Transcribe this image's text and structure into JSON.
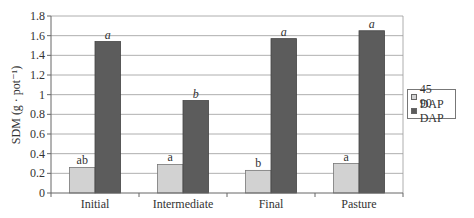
{
  "chart_data": {
    "type": "bar",
    "title": "",
    "xlabel": "",
    "ylabel": "SDM (g · pot⁻¹)",
    "ylim": [
      0,
      1.8
    ],
    "yticks": [
      "0",
      "0.2",
      "0.4",
      "0.6",
      "0.8",
      "1",
      "1.2",
      "1.4",
      "1.6",
      "1.8"
    ],
    "grid": true,
    "legend_position": "right",
    "categories": [
      "Initial",
      "Intermediate",
      "Final",
      "Pasture"
    ],
    "series": [
      {
        "name": "45 DAP",
        "color": "#d2d2d2",
        "values": [
          0.26,
          0.29,
          0.23,
          0.3
        ],
        "letters": [
          "ab",
          "a",
          "b",
          "a"
        ],
        "letter_style": "normal"
      },
      {
        "name": "90 DAP",
        "color": "#5c5c5c",
        "values": [
          1.54,
          0.94,
          1.57,
          1.65
        ],
        "letters": [
          "a",
          "b",
          "a",
          "a"
        ],
        "letter_style": "italic"
      }
    ]
  },
  "legend": {
    "items": [
      {
        "label": "45 DAP",
        "color": "#d2d2d2"
      },
      {
        "label": "90 DAP",
        "color": "#5c5c5c"
      }
    ]
  },
  "axis": {
    "ylabel": "SDM (g · pot⁻¹)"
  }
}
